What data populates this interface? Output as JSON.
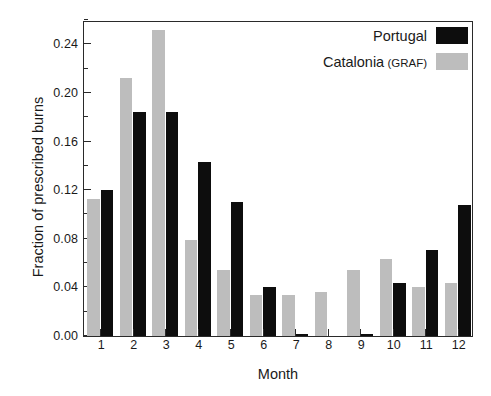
{
  "chart_data": {
    "type": "bar",
    "title": "",
    "xlabel": "Month",
    "ylabel": "Fraction of prescribed burns",
    "categories": [
      "1",
      "2",
      "3",
      "4",
      "5",
      "6",
      "7",
      "8",
      "9",
      "10",
      "11",
      "12"
    ],
    "ylim": [
      0.0,
      0.26
    ],
    "yticks": [
      0.0,
      0.04,
      0.08,
      0.12,
      0.16,
      0.2,
      0.24
    ],
    "ytick_labels": [
      "0.00",
      "0.04",
      "0.08",
      "0.12",
      "0.16",
      "0.20",
      "0.24"
    ],
    "yminor_step": 0.02,
    "grid": false,
    "legend_position": "top-right",
    "series": [
      {
        "name": "Portugal",
        "color": "#0d0d0d",
        "values": [
          0.12,
          0.184,
          0.184,
          0.143,
          0.11,
          0.04,
          0.002,
          0.0,
          0.002,
          0.044,
          0.071,
          0.108
        ]
      },
      {
        "name": "Catalonia (GRAF)",
        "color": "#bdbdbd",
        "values": [
          0.113,
          0.212,
          0.252,
          0.079,
          0.054,
          0.034,
          0.034,
          0.036,
          0.054,
          0.063,
          0.04,
          0.044
        ]
      }
    ]
  },
  "legend": {
    "entries": [
      {
        "label": "Portugal",
        "sublabel": "",
        "swatch": "portugal"
      },
      {
        "label": "Catalonia",
        "sublabel": " (GRAF)",
        "swatch": "catalonia"
      }
    ]
  },
  "colors": {
    "portugal": "#0d0d0d",
    "catalonia": "#bdbdbd",
    "axis": "#2a2a2a",
    "background": "#ffffff"
  }
}
